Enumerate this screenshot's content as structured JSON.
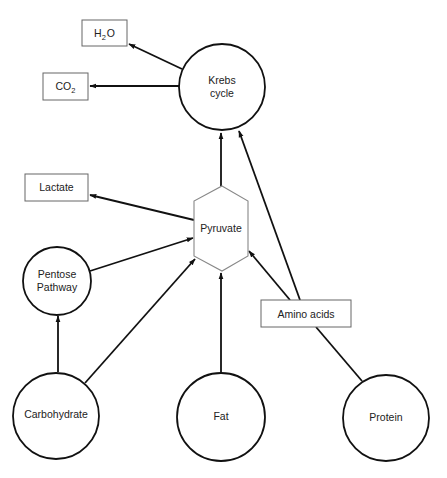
{
  "diagram": {
    "type": "metabolic-pathway",
    "nodes": {
      "krebs": {
        "shape": "circle",
        "line1": "Krebs",
        "line2": "cycle"
      },
      "h2o": {
        "shape": "box",
        "main": "H",
        "sub": "2",
        "tail": "O"
      },
      "co2": {
        "shape": "box",
        "main": "CO",
        "sub": "2"
      },
      "lactate": {
        "shape": "box",
        "label": "Lactate"
      },
      "pyruvate": {
        "shape": "hexagon",
        "label": "Pyruvate"
      },
      "pentose": {
        "shape": "circle",
        "line1": "Pentose",
        "line2": "Pathway"
      },
      "amino_acids": {
        "shape": "box",
        "label": "Amino acids"
      },
      "carbohydrate": {
        "shape": "circle",
        "label": "Carbohydrate"
      },
      "fat": {
        "shape": "circle",
        "label": "Fat"
      },
      "protein": {
        "shape": "circle",
        "label": "Protein"
      }
    },
    "edges": [
      {
        "from": "Krebs cycle",
        "to": "H2O",
        "arrow": true
      },
      {
        "from": "Krebs cycle",
        "to": "CO2",
        "arrow": true
      },
      {
        "from": "Pyruvate",
        "to": "Krebs cycle",
        "arrow": true
      },
      {
        "from": "Amino acids",
        "to": "Krebs cycle",
        "arrow": true
      },
      {
        "from": "Pyruvate",
        "to": "Lactate",
        "arrow": true
      },
      {
        "from": "Pentose Pathway",
        "to": "Pyruvate",
        "arrow": true
      },
      {
        "from": "Carbohydrate",
        "to": "Pyruvate",
        "arrow": true
      },
      {
        "from": "Fat",
        "to": "Pyruvate",
        "arrow": true
      },
      {
        "from": "Amino acids",
        "to": "Pyruvate",
        "arrow": true
      },
      {
        "from": "Carbohydrate",
        "to": "Pentose Pathway",
        "arrow": true
      },
      {
        "from": "Protein",
        "to": "Amino acids",
        "arrow": false
      }
    ]
  }
}
